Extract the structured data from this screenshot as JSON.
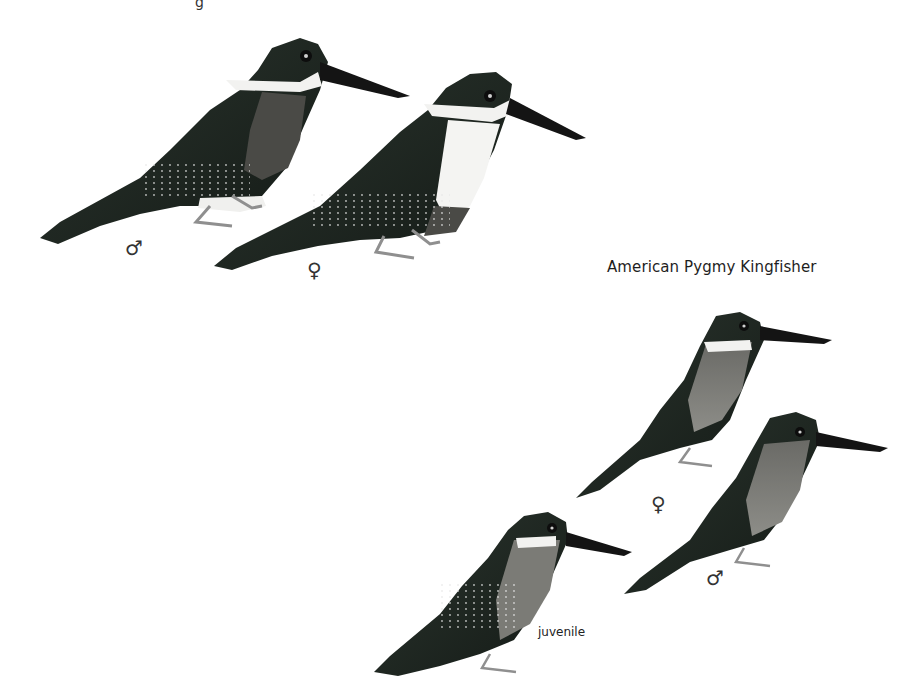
{
  "plate": {
    "top_cut_text": "g",
    "species_title": "American Pygmy Kingfisher",
    "upper_group": {
      "birds": [
        {
          "id": "large-male",
          "label": "♂"
        },
        {
          "id": "large-female",
          "label": "♀"
        }
      ]
    },
    "pygmy_group": {
      "birds": [
        {
          "id": "pygmy-female",
          "label": "♀"
        },
        {
          "id": "pygmy-male",
          "label": "♂"
        },
        {
          "id": "pygmy-juvenile",
          "label": "juvenile"
        }
      ]
    },
    "colors": {
      "background": "#ffffff",
      "plumage_dark": "#1f2a22",
      "plumage_mid": "#3a4a3e",
      "rufous": "#7a5a48",
      "white": "#f4f4f2",
      "bill": "#151515",
      "legs": "#9a9a9a"
    }
  }
}
